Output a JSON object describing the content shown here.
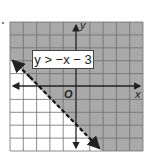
{
  "figure": {
    "inequality_label": "y > −x − 3",
    "x_axis_label": "x",
    "y_axis_label": "y",
    "origin_label": "O",
    "boundary": "dashed",
    "shaded_region": "above line"
  },
  "grid": {
    "x_range": [
      -5,
      5
    ],
    "y_range": [
      -5,
      5
    ],
    "cell_size": 1
  },
  "boundary_line": {
    "equation": "y = -x - 3",
    "slope": -1,
    "y_intercept": -3,
    "x_intercept": -3,
    "style": "dashed",
    "endpoints": [
      [
        -5,
        2
      ],
      [
        2,
        -5
      ]
    ]
  },
  "colors": {
    "shade": "#a9a9a9",
    "grid_line": "#6e6e6e",
    "axis": "#222222",
    "background": "#ffffff"
  }
}
